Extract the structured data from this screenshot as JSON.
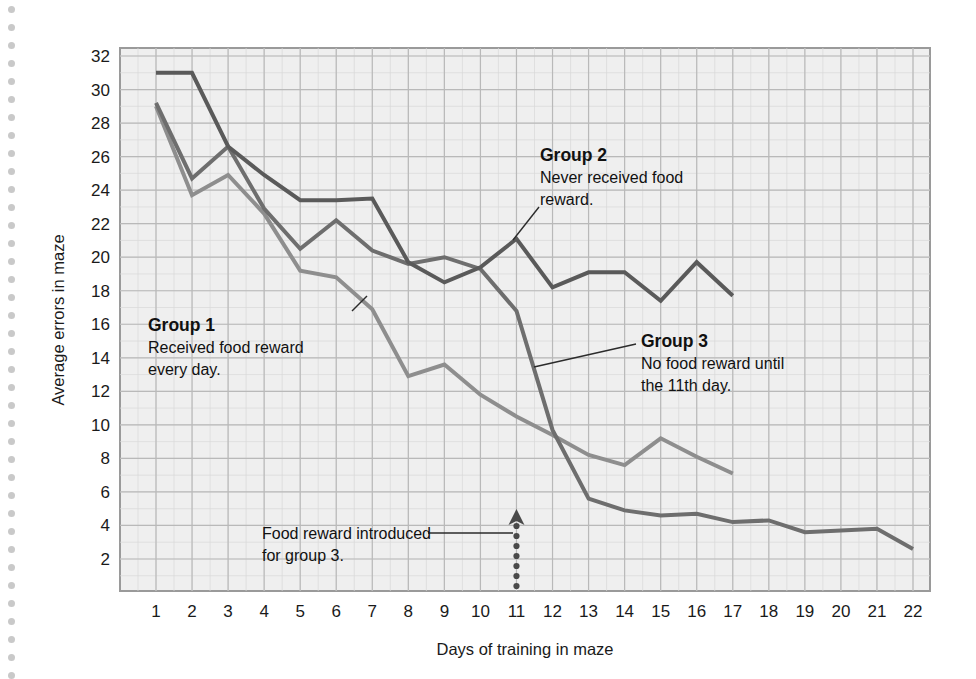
{
  "figure": {
    "background_color": "#ffffff",
    "plot_background_color": "#efefef",
    "grid_color": "#b9b9b9",
    "minor_grid_color": "#d8d8d8",
    "border_color": "#9a9a9a"
  },
  "chart_data": {
    "type": "line",
    "title": "",
    "xlabel": "Days of training in maze",
    "ylabel": "Average errors in maze",
    "x": [
      1,
      2,
      3,
      4,
      5,
      6,
      7,
      8,
      9,
      10,
      11,
      12,
      13,
      14,
      15,
      16,
      17,
      18,
      19,
      20,
      21,
      22
    ],
    "xticklabels": [
      "1",
      "2",
      "3",
      "4",
      "5",
      "6",
      "7",
      "8",
      "9",
      "10",
      "11",
      "12",
      "13",
      "14",
      "15",
      "16",
      "17",
      "18",
      "19",
      "20",
      "21",
      "22"
    ],
    "yticks": [
      2,
      4,
      6,
      8,
      10,
      12,
      14,
      16,
      18,
      20,
      22,
      24,
      26,
      28,
      30,
      32
    ],
    "yticklabels": [
      "2",
      "4",
      "6",
      "8",
      "10",
      "12",
      "14",
      "16",
      "18",
      "20",
      "22",
      "24",
      "26",
      "28",
      "30",
      "32"
    ],
    "xlim": [
      0.5,
      22.5
    ],
    "ylim": [
      1,
      32
    ],
    "grid": true,
    "legend_position": "inline-annotations",
    "series": [
      {
        "name": "Group 1",
        "color": "#8e8e8e",
        "linewidth": 4,
        "x": [
          1,
          2,
          3,
          4,
          5,
          6,
          7,
          8,
          9,
          10,
          11,
          12,
          13,
          14,
          15,
          16,
          17
        ],
        "values": [
          29.0,
          23.7,
          24.9,
          22.6,
          19.2,
          18.8,
          16.9,
          12.9,
          13.6,
          11.8,
          10.5,
          9.4,
          8.2,
          7.6,
          9.2,
          8.1,
          7.1
        ]
      },
      {
        "name": "Group 2",
        "color": "#5a5a5a",
        "linewidth": 4,
        "x": [
          1,
          2,
          3,
          4,
          5,
          6,
          7,
          8,
          9,
          10,
          11,
          12,
          13,
          14,
          15,
          16,
          17
        ],
        "values": [
          31.0,
          31.0,
          26.6,
          24.9,
          23.4,
          23.4,
          23.5,
          19.7,
          18.5,
          19.4,
          21.1,
          18.2,
          19.1,
          19.1,
          17.4,
          19.7,
          17.7
        ]
      },
      {
        "name": "Group 3",
        "color": "#6e6e6e",
        "linewidth": 4,
        "x": [
          1,
          2,
          3,
          4,
          5,
          6,
          7,
          8,
          9,
          10,
          11,
          12,
          13,
          14,
          15,
          16,
          17,
          18,
          19,
          20,
          21,
          22
        ],
        "values": [
          29.2,
          24.7,
          26.6,
          22.9,
          20.5,
          22.2,
          20.4,
          19.6,
          20.0,
          19.3,
          16.8,
          9.7,
          5.6,
          4.9,
          4.6,
          4.7,
          4.2,
          4.3,
          3.6,
          3.7,
          3.8,
          2.6
        ]
      }
    ],
    "annotations": [
      {
        "id": "group-1",
        "title": "Group 1",
        "lines": [
          "Received food reward",
          "every day."
        ],
        "leader_from": [
          190,
          355
        ],
        "leader_to": [
          355,
          312
        ]
      },
      {
        "id": "group-2",
        "title": "Group 2",
        "lines": [
          "Never received food",
          "reward."
        ],
        "leader_from": [
          540,
          208
        ],
        "leader_to": [
          513,
          238
        ]
      },
      {
        "id": "group-3",
        "title": "Group 3",
        "lines": [
          "No food reward until",
          "the 11th day."
        ],
        "leader_from": [
          637,
          345
        ],
        "leader_to": [
          533,
          366
        ]
      },
      {
        "id": "food-reward-marker",
        "title": "",
        "lines": [
          "Food reward introduced",
          "for group 3."
        ],
        "marker": "dotted-up-arrow",
        "marker_day": 11
      }
    ]
  },
  "annotation_text": {
    "group1_title": "Group 1",
    "group1_line1": "Received food reward",
    "group1_line2": "every day.",
    "group2_title": "Group 2",
    "group2_line1": "Never received food",
    "group2_line2": "reward.",
    "group3_title": "Group 3",
    "group3_line1": "No food reward until",
    "group3_line2": "the 11th day.",
    "marker_line1": "Food reward introduced",
    "marker_line2": "for group 3."
  },
  "axes": {
    "x_title": "Days of training in maze",
    "y_title": "Average errors in maze"
  }
}
